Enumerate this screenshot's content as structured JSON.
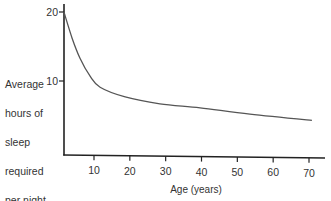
{
  "chart_data": {
    "type": "line",
    "title": "",
    "xlabel": "Age (years)",
    "ylabel_lines": [
      "Average",
      "hours of",
      "sleep",
      "required",
      "per night"
    ],
    "x_ticks": [
      10,
      20,
      30,
      40,
      50,
      60,
      70
    ],
    "y_ticks": [
      10,
      20
    ],
    "xlim": [
      1.6,
      75
    ],
    "ylim": [
      0,
      21.5
    ],
    "grid": false,
    "legend": "none",
    "series": [
      {
        "name": "Average hours of sleep required per night",
        "color": "#555555",
        "points": [
          [
            1.6,
            20.0
          ],
          [
            3.9,
            16.2
          ],
          [
            6.1,
            13.3
          ],
          [
            8.9,
            10.7
          ],
          [
            11.7,
            9.1
          ],
          [
            18.7,
            7.7
          ],
          [
            28.4,
            6.7
          ],
          [
            39.6,
            6.1
          ],
          [
            53.5,
            5.2
          ],
          [
            70.8,
            4.3
          ]
        ]
      }
    ]
  }
}
